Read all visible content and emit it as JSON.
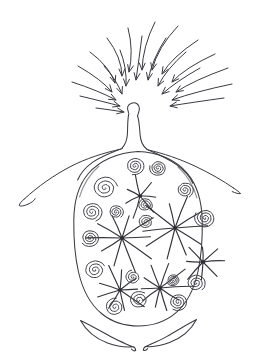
{
  "document": {
    "title": "Hand-drawn ink sketch",
    "medium": "pen and ink line drawing",
    "background_color": "#ffffff",
    "ink_color": "#3a3a42",
    "width": 260,
    "height": 362
  },
  "figure": {
    "name": "bulb-with-converging-arrows"
  },
  "parts": {
    "arrow_field": {
      "label": "converging-arrow-field",
      "count": 20,
      "target_x": 132,
      "target_y": 112,
      "note": "arrows point inward toward the top of the neck"
    },
    "neck": {
      "label": "neck-stem",
      "top_y": 104,
      "bottom_y": 150
    },
    "body": {
      "label": "bulb-body",
      "center_x": 138,
      "center_y": 238,
      "radius_x": 63,
      "radius_y": 88
    },
    "tendril_left": {
      "label": "left-tendril",
      "tip_x": 20,
      "tip_y": 206
    },
    "tendril_right": {
      "label": "right-tendril",
      "tip_x": 242,
      "tip_y": 192
    },
    "blades": {
      "label": "bottom-crescent-blades",
      "count": 2
    }
  },
  "sketch_data": {
    "type": "line-drawing",
    "arrows": [
      {
        "x1": 155,
        "y1": 22,
        "x2": 142,
        "y2": 70,
        "curve": -6
      },
      {
        "x1": 128,
        "y1": 28,
        "x2": 129,
        "y2": 72,
        "curve": 5
      },
      {
        "x1": 178,
        "y1": 26,
        "x2": 152,
        "y2": 70,
        "curve": -7
      },
      {
        "x1": 107,
        "y1": 38,
        "x2": 122,
        "y2": 76,
        "curve": 7
      },
      {
        "x1": 198,
        "y1": 40,
        "x2": 162,
        "y2": 74,
        "curve": -8
      },
      {
        "x1": 142,
        "y1": 36,
        "x2": 136,
        "y2": 80,
        "curve": 0
      },
      {
        "x1": 166,
        "y1": 38,
        "x2": 148,
        "y2": 80,
        "curve": -5
      },
      {
        "x1": 90,
        "y1": 52,
        "x2": 115,
        "y2": 83,
        "curve": 8
      },
      {
        "x1": 215,
        "y1": 54,
        "x2": 172,
        "y2": 82,
        "curve": -9
      },
      {
        "x1": 120,
        "y1": 50,
        "x2": 126,
        "y2": 86,
        "curve": 4
      },
      {
        "x1": 186,
        "y1": 52,
        "x2": 158,
        "y2": 86,
        "curve": -5
      },
      {
        "x1": 78,
        "y1": 66,
        "x2": 112,
        "y2": 92,
        "curve": 7
      },
      {
        "x1": 228,
        "y1": 68,
        "x2": 176,
        "y2": 92,
        "curve": -8
      },
      {
        "x1": 104,
        "y1": 66,
        "x2": 122,
        "y2": 94,
        "curve": 4
      },
      {
        "x1": 200,
        "y1": 68,
        "x2": 162,
        "y2": 94,
        "curve": -4
      },
      {
        "x1": 72,
        "y1": 82,
        "x2": 116,
        "y2": 100,
        "curve": 5
      },
      {
        "x1": 232,
        "y1": 84,
        "x2": 172,
        "y2": 100,
        "curve": -6
      },
      {
        "x1": 80,
        "y1": 96,
        "x2": 120,
        "y2": 106,
        "curve": 3
      },
      {
        "x1": 224,
        "y1": 98,
        "x2": 170,
        "y2": 106,
        "curve": -4
      },
      {
        "x1": 96,
        "y1": 108,
        "x2": 124,
        "y2": 112,
        "curve": 2
      }
    ],
    "starbursts": [
      {
        "cx": 122,
        "cy": 238,
        "rays": 10,
        "len": 34
      },
      {
        "cx": 175,
        "cy": 228,
        "rays": 10,
        "len": 36
      },
      {
        "cx": 120,
        "cy": 290,
        "rays": 9,
        "len": 28
      },
      {
        "cx": 160,
        "cy": 288,
        "rays": 10,
        "len": 30
      },
      {
        "cx": 203,
        "cy": 262,
        "rays": 8,
        "len": 24
      },
      {
        "cx": 140,
        "cy": 196,
        "rays": 7,
        "len": 22
      }
    ],
    "spirals": [
      {
        "cx": 105,
        "cy": 188,
        "r": 12
      },
      {
        "cx": 135,
        "cy": 166,
        "r": 9
      },
      {
        "cx": 158,
        "cy": 168,
        "r": 8
      },
      {
        "cx": 92,
        "cy": 212,
        "r": 10
      },
      {
        "cx": 116,
        "cy": 212,
        "r": 7
      },
      {
        "cx": 145,
        "cy": 205,
        "r": 7
      },
      {
        "cx": 185,
        "cy": 190,
        "r": 8
      },
      {
        "cx": 205,
        "cy": 218,
        "r": 10
      },
      {
        "cx": 146,
        "cy": 222,
        "r": 7
      },
      {
        "cx": 90,
        "cy": 238,
        "r": 9
      },
      {
        "cx": 95,
        "cy": 270,
        "r": 10
      },
      {
        "cx": 196,
        "cy": 283,
        "r": 9
      },
      {
        "cx": 133,
        "cy": 277,
        "r": 7
      },
      {
        "cx": 173,
        "cy": 280,
        "r": 6
      },
      {
        "cx": 115,
        "cy": 307,
        "r": 9
      },
      {
        "cx": 139,
        "cy": 300,
        "r": 9
      },
      {
        "cx": 178,
        "cy": 302,
        "r": 9
      }
    ]
  }
}
